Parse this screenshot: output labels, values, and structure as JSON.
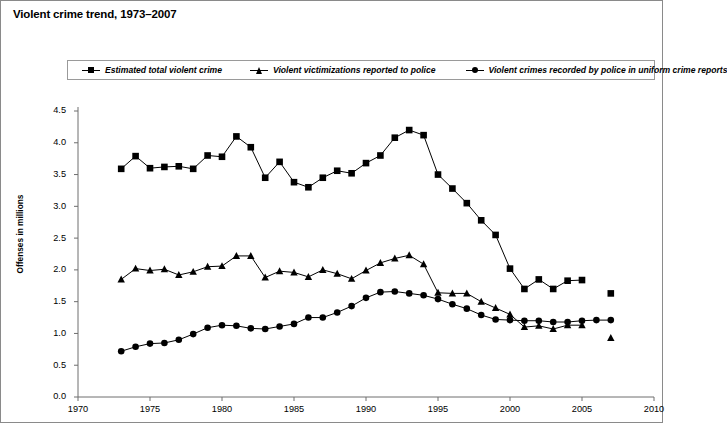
{
  "title": "Violent crime trend, 1973–2007",
  "footnote": "",
  "legend": {
    "position": "top",
    "entries": [
      {
        "label": "Estimated total violent crime",
        "marker": "square"
      },
      {
        "label": "Violent victimizations reported to police",
        "marker": "triangle"
      },
      {
        "label": "Violent crimes recorded by police in uniform crime reports",
        "marker": "circle"
      }
    ]
  },
  "axes": {
    "ylabel": "Offenses in millions",
    "xlabel": "",
    "yticks": [
      "0.0",
      "0.5",
      "1.0",
      "1.5",
      "2.0",
      "2.5",
      "3.0",
      "3.5",
      "4.0",
      "4.5"
    ],
    "xticks": [
      "1970",
      "1975",
      "1980",
      "1985",
      "1990",
      "1995",
      "2000",
      "2005",
      "2010"
    ]
  },
  "chart_data": {
    "type": "line",
    "title": "Violent crime trend, 1973–2007",
    "xlabel": "",
    "ylabel": "Offenses in millions",
    "xlim": [
      1970,
      2010
    ],
    "ylim": [
      0.0,
      4.5
    ],
    "grid": false,
    "legend_position": "top",
    "x": [
      1973,
      1974,
      1975,
      1976,
      1977,
      1978,
      1979,
      1980,
      1981,
      1982,
      1983,
      1984,
      1985,
      1986,
      1987,
      1988,
      1989,
      1990,
      1991,
      1992,
      1993,
      1994,
      1995,
      1996,
      1997,
      1998,
      1999,
      2000,
      2001,
      2002,
      2003,
      2004,
      2005,
      2006,
      2007
    ],
    "series": [
      {
        "name": "Estimated total violent crime",
        "marker": "square",
        "values": [
          3.59,
          3.79,
          3.6,
          3.62,
          3.63,
          3.59,
          3.8,
          3.78,
          4.1,
          3.93,
          3.45,
          3.7,
          3.38,
          3.3,
          3.45,
          3.56,
          3.52,
          3.68,
          3.8,
          4.08,
          4.2,
          4.12,
          3.5,
          3.28,
          3.05,
          2.78,
          2.55,
          2.02,
          1.7,
          1.85,
          1.7,
          1.83,
          1.84,
          null,
          1.63
        ]
      },
      {
        "name": "Violent victimizations reported to police",
        "marker": "triangle",
        "values": [
          1.85,
          2.02,
          1.99,
          2.01,
          1.92,
          1.97,
          2.05,
          2.06,
          2.22,
          2.22,
          1.88,
          1.98,
          1.96,
          1.89,
          2.0,
          1.94,
          1.86,
          1.99,
          2.11,
          2.18,
          2.23,
          2.09,
          1.64,
          1.63,
          1.63,
          1.5,
          1.4,
          1.3,
          1.1,
          1.12,
          1.07,
          1.13,
          1.13,
          null,
          0.93
        ]
      },
      {
        "name": "Violent crimes recorded by police in uniform crime reports",
        "marker": "circle",
        "values": [
          0.72,
          0.79,
          0.84,
          0.85,
          0.9,
          0.99,
          1.09,
          1.13,
          1.12,
          1.08,
          1.07,
          1.11,
          1.15,
          1.25,
          1.25,
          1.33,
          1.43,
          1.56,
          1.65,
          1.66,
          1.63,
          1.6,
          1.54,
          1.46,
          1.39,
          1.29,
          1.22,
          1.21,
          1.2,
          1.2,
          1.18,
          1.18,
          1.2,
          1.21,
          1.21
        ]
      }
    ]
  }
}
